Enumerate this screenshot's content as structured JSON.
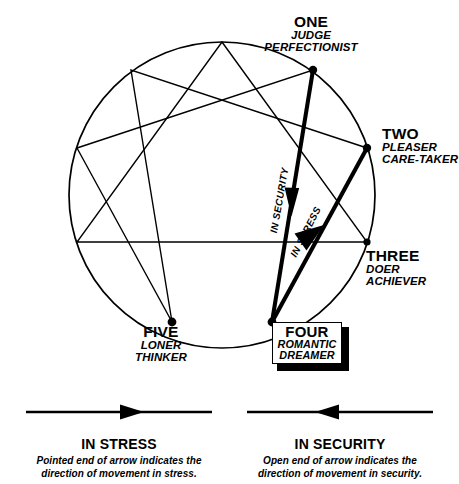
{
  "diagram": {
    "stroke_color": "#000000",
    "background_color": "#ffffff",
    "circle": {
      "cx": 222,
      "cy": 195,
      "r": 153
    },
    "points": [
      {
        "id": "one",
        "name": "ONE",
        "traits": [
          "JUDGE",
          "PERFECTIONIST"
        ],
        "vertex": [
          313,
          70
        ]
      },
      {
        "id": "two",
        "name": "TWO",
        "traits": [
          "PLEASER",
          "CARE-TAKER"
        ],
        "vertex": [
          366,
          152
        ]
      },
      {
        "id": "three",
        "name": "THREE",
        "traits": [
          "DOER",
          "ACHIEVER"
        ],
        "vertex": [
          358,
          255
        ]
      },
      {
        "id": "four",
        "name": "FOUR",
        "traits": [
          "ROMANTIC",
          "DREAMER"
        ],
        "vertex": [
          272,
          322
        ],
        "highlighted": true
      },
      {
        "id": "five",
        "name": "FIVE",
        "traits": [
          "LONER",
          "THINKER"
        ],
        "vertex": [
          173,
          320
        ]
      }
    ],
    "arrows": [
      {
        "id": "in-security",
        "label": "IN SECURITY",
        "from": "one",
        "to": "four",
        "head": "pointed-down"
      },
      {
        "id": "in-stress",
        "label": "IN  STRESS",
        "from": "four",
        "to": "two",
        "head": "pointed-up"
      }
    ]
  },
  "legend": {
    "stress": {
      "title": "IN STRESS",
      "description_line1": "Pointed end of arrow indicates the",
      "description_line2": "direction of movement in stress.",
      "arrow_direction": "right"
    },
    "security": {
      "title": "IN SECURITY",
      "description_line1": "Open end of arrow indicates the",
      "description_line2": "direction of movement in security.",
      "arrow_direction": "left"
    }
  }
}
